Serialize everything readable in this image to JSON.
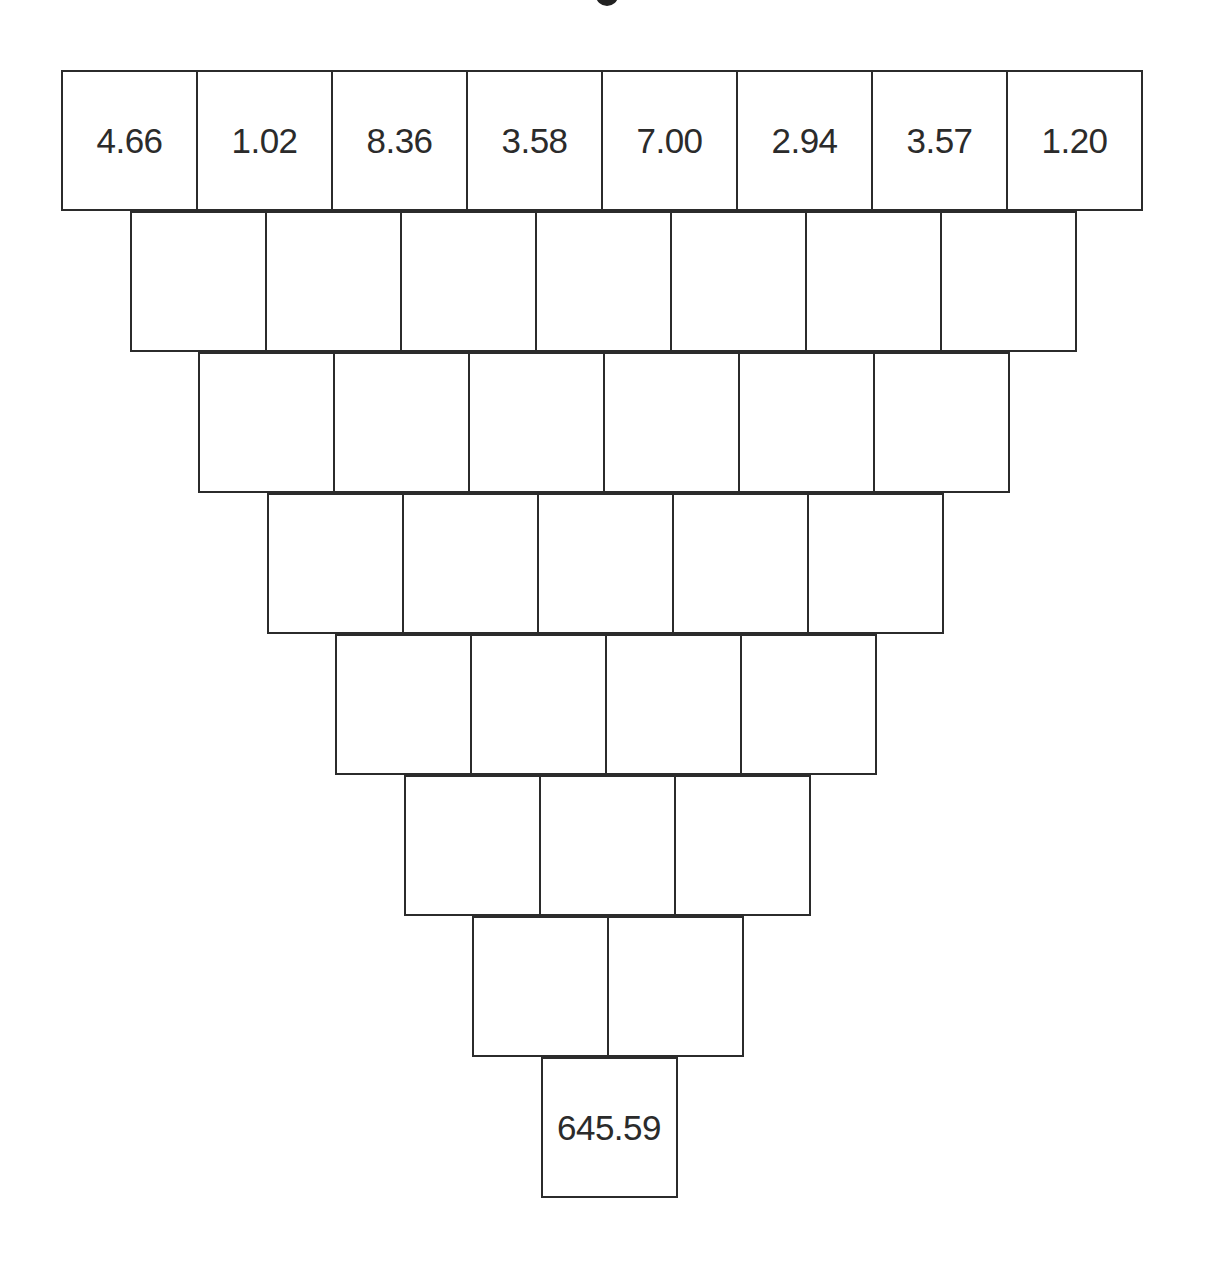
{
  "diagram": {
    "type": "inverted-number-pyramid",
    "row_count": 8,
    "rows": [
      {
        "cells": [
          "4.66",
          "1.02",
          "8.36",
          "3.58",
          "7.00",
          "2.94",
          "3.57",
          "1.20"
        ]
      },
      {
        "cells": [
          "",
          "",
          "",
          "",
          "",
          "",
          ""
        ]
      },
      {
        "cells": [
          "",
          "",
          "",
          "",
          "",
          ""
        ]
      },
      {
        "cells": [
          "",
          "",
          "",
          "",
          ""
        ]
      },
      {
        "cells": [
          "",
          "",
          "",
          ""
        ]
      },
      {
        "cells": [
          "",
          "",
          ""
        ]
      },
      {
        "cells": [
          "",
          ""
        ]
      },
      {
        "cells": [
          "645.59"
        ]
      }
    ],
    "colors": {
      "border": "#2b2b2b",
      "text": "#2b2b2b",
      "background": "#ffffff"
    }
  }
}
